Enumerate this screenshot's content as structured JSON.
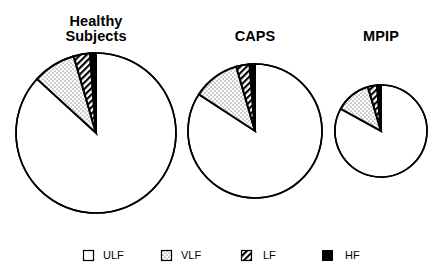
{
  "chart_data": {
    "type": "pie",
    "title": "",
    "legend": {
      "position": "bottom",
      "entries": [
        {
          "label": "ULF",
          "pattern": "empty"
        },
        {
          "label": "VLF",
          "pattern": "dotted"
        },
        {
          "label": "LF",
          "pattern": "diagonal-hatch"
        },
        {
          "label": "HF",
          "pattern": "solid-black"
        }
      ]
    },
    "categories": [
      "ULF",
      "VLF",
      "LF",
      "HF"
    ],
    "pies": [
      {
        "name": "Healthy Subjects",
        "title_lines": [
          "Healthy",
          "Subjects"
        ],
        "values": [
          86.8,
          8.7,
          3.3,
          1.2
        ]
      },
      {
        "name": "CAPS",
        "title_lines": [
          "CAPS"
        ],
        "values": [
          84.2,
          11.3,
          3.2,
          1.3
        ]
      },
      {
        "name": "MPIP",
        "title_lines": [
          "MPIP"
        ],
        "values": [
          83.0,
          12.4,
          3.2,
          1.4
        ]
      }
    ],
    "note": "Relative pie sizes differ: Healthy Subjects largest, CAPS medium, MPIP smallest",
    "grid": false
  },
  "titles": {
    "healthy_line1": "Healthy",
    "healthy_line2": "Subjects",
    "caps": "CAPS",
    "mpip": "MPIP"
  },
  "legend": {
    "ulf": "ULF",
    "vlf": "VLF",
    "lf": "LF",
    "hf": "HF"
  },
  "colors": {
    "stroke": "#000000",
    "background": "#ffffff"
  }
}
